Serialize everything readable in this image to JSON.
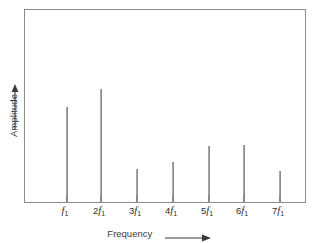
{
  "chart_data": {
    "type": "bar",
    "title": "",
    "subtitle": "",
    "xlabel": "Frequency",
    "ylabel": "Amplitude",
    "xlabel_arrow": "right-arrow",
    "ylabel_arrow": "up-arrow",
    "grid": false,
    "legend": null,
    "legend_position": "none",
    "axis_frame": "full-box",
    "categories": [
      "f1",
      "2f1",
      "3f1",
      "4f1",
      "5f1",
      "6f1",
      "7f1"
    ],
    "tick_labels": [
      {
        "coefficient": "",
        "symbol": "f",
        "subscript": "1"
      },
      {
        "coefficient": "2",
        "symbol": "f",
        "subscript": "1"
      },
      {
        "coefficient": "3",
        "symbol": "f",
        "subscript": "1"
      },
      {
        "coefficient": "4",
        "symbol": "f",
        "subscript": "1"
      },
      {
        "coefficient": "5",
        "symbol": "f",
        "subscript": "1"
      },
      {
        "coefficient": "6",
        "symbol": "f",
        "subscript": "1"
      },
      {
        "coefficient": "7",
        "symbol": "f",
        "subscript": "1"
      }
    ],
    "values": [
      0.495,
      0.588,
      0.17,
      0.206,
      0.294,
      0.299,
      0.16
    ],
    "ylim": [
      0,
      1
    ],
    "xlim": [
      0,
      1
    ],
    "series": [
      {
        "name": "Harmonic amplitude",
        "values": [
          0.495,
          0.588,
          0.17,
          0.206,
          0.294,
          0.299,
          0.16
        ]
      }
    ],
    "x_positions_frac": [
      0.1454,
      0.2695,
      0.3972,
      0.5248,
      0.6525,
      0.7801,
      0.9078
    ],
    "line_color": "#8a8a8a",
    "frame_color": "#8c8c8c",
    "text_color": "#2e2e2e",
    "background_color": "#ffffff"
  }
}
